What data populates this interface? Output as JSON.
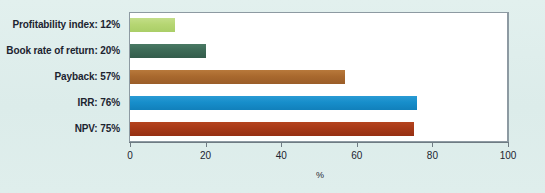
{
  "chart_data": {
    "type": "bar",
    "orientation": "horizontal",
    "title": "",
    "xlabel": "%",
    "ylabel": "",
    "xlim": [
      0,
      100
    ],
    "xticks": [
      0,
      20,
      40,
      60,
      80,
      100
    ],
    "xtick_labels": [
      "0",
      "20",
      "40",
      "60",
      "80",
      "100"
    ],
    "grid": false,
    "legend": "none",
    "categories": [
      "Profitability index: 12%",
      "Book rate of return: 20%",
      "Payback: 57%",
      "IRR: 76%",
      "NPV: 75%"
    ],
    "values": [
      12,
      20,
      57,
      76,
      75
    ],
    "bars": [
      {
        "label": "Profitability index: 12%",
        "value": 12,
        "color": "#b6d673",
        "key": "b-pi"
      },
      {
        "label": "Book rate of return: 20%",
        "value": 20,
        "color": "#3d6a57",
        "key": "b-brr"
      },
      {
        "label": "Payback: 57%",
        "value": 57,
        "color": "#a9692e",
        "key": "b-pb"
      },
      {
        "label": "IRR: 76%",
        "value": 76,
        "color": "#178ecb",
        "key": "b-irr"
      },
      {
        "label": "NPV: 75%",
        "value": 75,
        "color": "#a73a18",
        "key": "b-npv"
      }
    ]
  },
  "colors": {
    "background": "#dcecea",
    "plot_background": "#ffffff",
    "frame": "#8d9aa2",
    "axis": "#6f7b83",
    "text": "#1c2430"
  }
}
